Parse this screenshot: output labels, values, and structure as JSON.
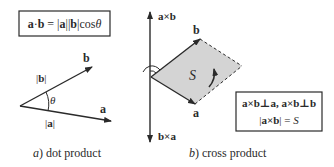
{
  "panels": [
    {
      "id": "dot",
      "caption_letter": "a",
      "caption_text": ") dot product",
      "formula": {
        "a": "a",
        "dot": "·",
        "b": "b",
        "eq": " = |",
        "a2": "a",
        "mid": "||",
        "b2": "b",
        "cos": "|cos",
        "theta": "θ"
      },
      "labels": {
        "vec_b": "b",
        "vec_a": "a",
        "mag_b_open": "|",
        "mag_b": "b",
        "mag_b_close": "|",
        "mag_a_open": "|",
        "mag_a": "a",
        "mag_a_close": "|",
        "theta": "θ"
      }
    },
    {
      "id": "cross",
      "caption_letter": "b",
      "caption_text": ") cross product",
      "labels": {
        "axb": "a×b",
        "bxa": "b×a",
        "vec_b": "b",
        "vec_a": "a",
        "area": "S"
      },
      "formula_box": {
        "line1": "a×b⊥a, a×b⊥b",
        "line2_open": "|",
        "line2_vec": "a×b",
        "line2_close": "| = ",
        "line2_S": "S"
      }
    }
  ],
  "colors": {
    "stroke": "#2a2a2a",
    "parallelogram_fill": "#d4d4d4"
  }
}
